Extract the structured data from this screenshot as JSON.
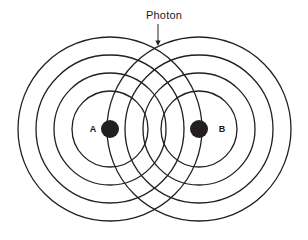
{
  "figure": {
    "title": "",
    "background_color": "#ffffff",
    "width": 308,
    "height": 240,
    "stroke_color": "#231f20",
    "fill_color": "#231f20",
    "annotation": {
      "label": "Photon",
      "label_x": 164,
      "label_y": 19,
      "arrow_from_x": 158,
      "arrow_from_y": 24,
      "arrow_to_x": 158,
      "arrow_to_y": 46,
      "marker_x": 158,
      "marker_y": 47,
      "marker_name": "photon-intersection-marker"
    },
    "sources": [
      {
        "name": "source-a",
        "label": "A",
        "cx": 110,
        "cy": 129,
        "dot_radius": 9,
        "label_x": 93,
        "label_y": 132,
        "wave_radii": [
          38,
          56,
          74,
          92
        ]
      },
      {
        "name": "source-b",
        "label": "B",
        "cx": 199,
        "cy": 129,
        "dot_radius": 9,
        "label_x": 222,
        "label_y": 132,
        "wave_radii": [
          38,
          56,
          74,
          92
        ]
      }
    ],
    "stroke_width": 1.3
  },
  "chart_data": {
    "type": "diagram",
    "xlabel": "",
    "ylabel": "",
    "annotations": [
      "Photon"
    ],
    "series": [
      {
        "name": "A",
        "center": [
          110,
          129
        ],
        "radii": [
          38,
          56,
          74,
          92
        ]
      },
      {
        "name": "B",
        "center": [
          199,
          129
        ],
        "radii": [
          38,
          56,
          74,
          92
        ]
      }
    ],
    "markers": [
      {
        "name": "Photon",
        "x": 158,
        "y": 47
      }
    ]
  }
}
